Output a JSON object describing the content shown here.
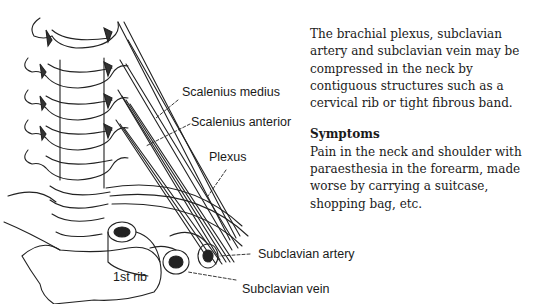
{
  "figure": {
    "labels": {
      "scalenius_medius": "Scalenius medius",
      "scalenius_anterior": "Scalenius anterior",
      "plexus": "Plexus",
      "subclavian_artery": "Subclavian artery",
      "first_rib": "1st rib",
      "subclavian_vein": "Subclavian vein"
    }
  },
  "text": {
    "intro": "The brachial plexus, subclavian artery and subclavian vein may be compressed in the neck by contiguous structures such as a cervical rib or tight fibrous band.",
    "symptoms_heading": "Symptoms",
    "symptoms_body": "Pain in the neck and shoulder with paraesthesia in the forearm, made worse by carrying a suitcase, shopping bag, etc."
  }
}
